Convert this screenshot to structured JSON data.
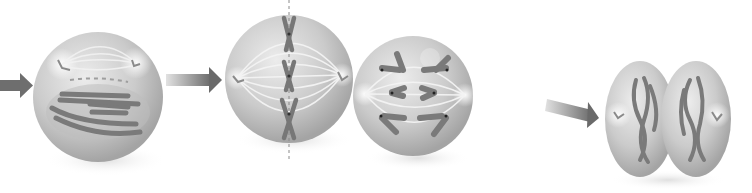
{
  "diagram": {
    "type": "process-sequence",
    "stages": [
      {
        "id": "stage-1",
        "depiction": "cell with spindle poles forming and condensed chromosomes",
        "cx": 100,
        "cy": 96,
        "r": 66
      },
      {
        "id": "stage-2",
        "depiction": "cell with chromosomes aligned on a dashed central plate and spindle fibers",
        "cx": 289,
        "cy": 78,
        "r": 64
      },
      {
        "id": "stage-3",
        "depiction": "cell with chromatids pulled toward opposite poles",
        "cx": 413,
        "cy": 96,
        "r": 60
      },
      {
        "id": "stage-4",
        "depiction": "cell pinching into two daughter cells with decondensing chromosomes",
        "cx": 667,
        "cy": 117
      }
    ],
    "arrows": [
      {
        "from": "start",
        "to": "stage-1"
      },
      {
        "from": "stage-1",
        "to": "stage-2"
      },
      {
        "from": "stage-2",
        "to": "stage-3"
      },
      {
        "from": "stage-3",
        "to": "stage-4"
      }
    ],
    "colors": {
      "cell_fill": "#c8c8c8",
      "cell_highlight": "#e8e8e8",
      "cell_shadow": "#9a9a9a",
      "chromosome": "#7a7a7a",
      "arrow_dark": "#6e6e6e",
      "arrow_light": "#d8d8d8",
      "background": "#ffffff"
    }
  }
}
